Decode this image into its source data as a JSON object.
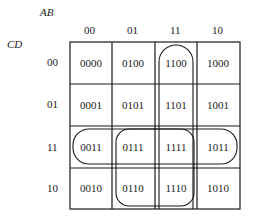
{
  "kmap": {
    "row_var": "CD",
    "col_var": "AB",
    "col_headers": [
      "00",
      "01",
      "11",
      "10"
    ],
    "row_headers": [
      "00",
      "01",
      "11",
      "10"
    ],
    "cells": [
      [
        "0000",
        "0100",
        "1100",
        "1000"
      ],
      [
        "0001",
        "0101",
        "1101",
        "1001"
      ],
      [
        "0011",
        "0111",
        "1111",
        "1011"
      ],
      [
        "0010",
        "0110",
        "1110",
        "1010"
      ]
    ],
    "groups": [
      {
        "name": "column-11-group",
        "cells": [
          "1100",
          "1101",
          "1111",
          "1110"
        ]
      },
      {
        "name": "row-11-group",
        "cells": [
          "0011",
          "0111",
          "1111",
          "1011"
        ]
      },
      {
        "name": "square-group",
        "cells": [
          "0111",
          "1111",
          "0110",
          "1110"
        ]
      }
    ]
  }
}
